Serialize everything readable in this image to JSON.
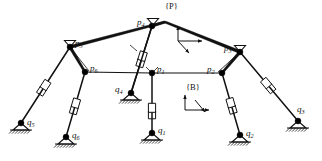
{
  "figure": {
    "type": "mechanism-diagram",
    "background_color": "#ffffff",
    "line_color": "#111111",
    "joint_fill": "#000000"
  },
  "frames": [
    {
      "id": "frame-p",
      "label": "{P}",
      "label_x": 165,
      "label_y": 9,
      "origin_x": 178,
      "origin_y": 41,
      "axes": [
        "up",
        "right",
        "down-left"
      ]
    },
    {
      "id": "frame-b",
      "label": "{B}",
      "label_x": 186,
      "label_y": 90,
      "origin_x": 185,
      "origin_y": 110,
      "axes": [
        "up",
        "right",
        "down-left"
      ]
    }
  ],
  "platform_nodes": [
    {
      "id": "p1",
      "base": "p",
      "sub": "1",
      "x": 152,
      "y": 73,
      "label_dx": 5,
      "label_dy": -1
    },
    {
      "id": "p2",
      "base": "p",
      "sub": "2",
      "x": 222,
      "y": 73,
      "label_dx": -15,
      "label_dy": -1
    },
    {
      "id": "p3",
      "base": "p",
      "sub": "3",
      "x": 240,
      "y": 52,
      "label_dx": -16,
      "label_dy": -1
    },
    {
      "id": "p4",
      "base": "p",
      "sub": "4",
      "x": 152,
      "y": 26,
      "label_dx": -15,
      "label_dy": -1
    },
    {
      "id": "p5",
      "base": "p",
      "sub": "5",
      "x": 70,
      "y": 47,
      "label_dx": 5,
      "label_dy": -1
    },
    {
      "id": "p6",
      "base": "p",
      "sub": "6",
      "x": 85,
      "y": 72,
      "label_dx": 5,
      "label_dy": -1
    }
  ],
  "base_nodes": [
    {
      "id": "q1",
      "base": "q",
      "sub": "1",
      "x": 152,
      "y": 133,
      "label_dx": 6,
      "label_dy": 0
    },
    {
      "id": "q2",
      "base": "q",
      "sub": "2",
      "x": 240,
      "y": 135,
      "label_dx": 6,
      "label_dy": 1
    },
    {
      "id": "q3",
      "base": "q",
      "sub": "3",
      "x": 298,
      "y": 121,
      "label_dx": -1,
      "label_dy": -9
    },
    {
      "id": "q4",
      "base": "q",
      "sub": "4",
      "x": 131,
      "y": 93,
      "label_dx": -16,
      "label_dy": -1
    },
    {
      "id": "q5",
      "base": "q",
      "sub": "5",
      "x": 21,
      "y": 123,
      "label_dx": 6,
      "label_dy": 2
    },
    {
      "id": "q6",
      "base": "q",
      "sub": "6",
      "x": 66,
      "y": 137,
      "label_dx": 6,
      "label_dy": 1
    }
  ],
  "platform_edges": [
    {
      "from": "p5",
      "to": "p4",
      "style": "tapered"
    },
    {
      "from": "p4",
      "to": "p3",
      "style": "tapered"
    },
    {
      "from": "p5",
      "to": "p6",
      "style": "tapered"
    },
    {
      "from": "p3",
      "to": "p2",
      "style": "tapered"
    },
    {
      "from": "p6",
      "to": "p1",
      "style": "bar"
    },
    {
      "from": "p1",
      "to": "p2",
      "style": "bar"
    },
    {
      "from": "p5",
      "to": "p1",
      "style": "bar"
    },
    {
      "from": "p2",
      "to": "p3",
      "style": "bar"
    }
  ],
  "apex": {
    "x": 165,
    "y": 22
  },
  "legs": [
    {
      "id": "leg1",
      "platform": "p1",
      "base": "q1",
      "actuated": true,
      "slider_t": 0.58
    },
    {
      "id": "leg2",
      "platform": "p2",
      "base": "q2",
      "actuated": true,
      "slider_t": 0.48
    },
    {
      "id": "leg3",
      "platform": "p3",
      "base": "q3",
      "actuated": true,
      "slider_t": 0.45
    },
    {
      "id": "leg4",
      "platform": "p4",
      "base": "q4",
      "actuated": true,
      "slider_t": 0.45
    },
    {
      "id": "leg5",
      "platform": "p5",
      "base": "q5",
      "actuated": true,
      "slider_t": 0.5
    },
    {
      "id": "leg6",
      "platform": "p6",
      "base": "q6",
      "actuated": true,
      "slider_t": 0.48
    }
  ],
  "ground_supports": [
    "q1",
    "q2",
    "q3",
    "q5",
    "q6",
    "q4"
  ],
  "spherical_joints": [
    "p5",
    "p3",
    "p4"
  ],
  "notes": {
    "joint_symbol": "filled-circle",
    "base_symbol": "triangle-with-hatching",
    "actuator_symbol": "prismatic-slider"
  }
}
